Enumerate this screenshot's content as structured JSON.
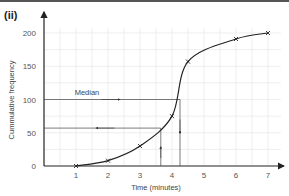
{
  "figure_label": "(ii)",
  "chart_data": {
    "type": "line",
    "title": "",
    "xlabel": "Time (minutes)",
    "ylabel": "Cummulative frequency",
    "xlim": [
      0,
      7.4
    ],
    "ylim": [
      0,
      210
    ],
    "x_ticks": [
      1,
      2,
      3,
      4,
      5,
      6,
      7
    ],
    "y_ticks": [
      0,
      50,
      100,
      150,
      200
    ],
    "grid": true,
    "series": [
      {
        "name": "Cumulative frequency curve",
        "x": [
          1,
          2,
          3,
          4,
          4.5,
          6,
          7
        ],
        "values": [
          0,
          8,
          30,
          75,
          157,
          191,
          200
        ]
      }
    ],
    "annotations": [
      {
        "text": "Median",
        "y": 100,
        "x_read": 4.25,
        "direction": "right-then-down"
      },
      {
        "text": "",
        "y": 57,
        "x_read": 3.65,
        "direction": "up-then-left"
      }
    ]
  },
  "annotation_median": "Median"
}
